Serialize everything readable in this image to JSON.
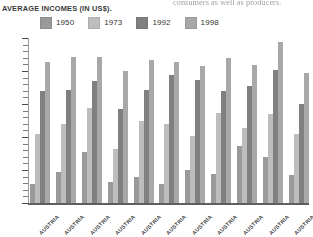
{
  "page_bleed_text": "consumers as well as producers.",
  "chart_title": {
    "lead": "A",
    "rest": "VERAGE ",
    "full": "Average Incomes (in US$)."
  },
  "legend": {
    "position": "top",
    "items": [
      {
        "label": "1950",
        "color": "#9a9a9a"
      },
      {
        "label": "1973",
        "color": "#bdbdbd"
      },
      {
        "label": "1992",
        "color": "#808080"
      },
      {
        "label": "1998",
        "color": "#a8a8a8"
      }
    ]
  },
  "chart_data": {
    "type": "bar",
    "title": "Average Incomes (in US$).",
    "xlabel": "",
    "ylabel": "",
    "grid": false,
    "legend_position": "top",
    "ylim": [
      0,
      100
    ],
    "categories": [
      "Austria",
      "Austria",
      "Austria",
      "Austria",
      "Austria",
      "Austria",
      "Austria",
      "Austria",
      "Austria",
      "Austria",
      "Austria"
    ],
    "series": [
      {
        "name": "1950",
        "color": "#9a9a9a",
        "values": [
          12,
          19,
          31,
          13,
          16,
          12,
          20,
          18,
          35,
          28,
          17
        ]
      },
      {
        "name": "1973",
        "color": "#bdbdbd",
        "values": [
          42,
          48,
          58,
          33,
          50,
          48,
          41,
          55,
          46,
          54,
          42
        ]
      },
      {
        "name": "1992",
        "color": "#808080",
        "values": [
          68,
          69,
          74,
          57,
          69,
          78,
          75,
          68,
          71,
          81,
          60
        ]
      },
      {
        "name": "1998",
        "color": "#a8a8a8",
        "values": [
          86,
          89,
          89,
          80,
          87,
          86,
          83,
          88,
          84,
          98,
          79
        ]
      }
    ]
  },
  "y_axis": {
    "tick_count": 26,
    "major_every": 5,
    "labels_visible": false
  }
}
